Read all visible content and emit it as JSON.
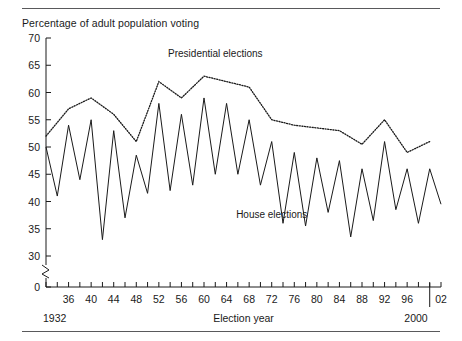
{
  "figure": {
    "y_axis_caption": "Percentage of adult population voting",
    "x_axis_title": "Election year",
    "start_year_label": "1932",
    "end_year_label": "2000",
    "rule_color": "#59595b"
  },
  "chart_data": {
    "type": "line",
    "title": "Percentage of adult population voting",
    "xlabel": "Election year",
    "ylabel": "Percentage of adult population voting",
    "ylim": [
      30,
      70
    ],
    "y_axis_break": true,
    "y_break_from": 30,
    "y_break_to": 0,
    "yticks": [
      0,
      30,
      35,
      40,
      45,
      50,
      55,
      60,
      65,
      70
    ],
    "ytick_labels": [
      "0",
      "30",
      "35",
      "40",
      "45",
      "50",
      "55",
      "60",
      "65",
      "70"
    ],
    "xlim": [
      1932,
      2002
    ],
    "xticks": [
      1932,
      1934,
      1936,
      1938,
      1940,
      1942,
      1944,
      1946,
      1948,
      1950,
      1952,
      1954,
      1956,
      1958,
      1960,
      1962,
      1964,
      1966,
      1968,
      1970,
      1972,
      1974,
      1976,
      1978,
      1980,
      1982,
      1984,
      1986,
      1988,
      1990,
      1992,
      1994,
      1996,
      1998,
      2000,
      2002
    ],
    "xtick_labels": [
      "",
      "",
      "36",
      "",
      "40",
      "",
      "44",
      "",
      "48",
      "",
      "52",
      "",
      "56",
      "",
      "60",
      "",
      "64",
      "",
      "68",
      "",
      "72",
      "",
      "76",
      "",
      "80",
      "",
      "84",
      "",
      "88",
      "",
      "92",
      "",
      "96",
      "",
      "",
      "02"
    ],
    "grid": false,
    "legend_position": "inline-annotations",
    "series": [
      {
        "name": "Presidential elections",
        "style": "dotted",
        "x": [
          1932,
          1936,
          1940,
          1944,
          1948,
          1952,
          1956,
          1960,
          1964,
          1968,
          1972,
          1976,
          1980,
          1984,
          1988,
          1992,
          1996,
          2000
        ],
        "values": [
          52.0,
          57.0,
          59.0,
          56.0,
          51.0,
          62.0,
          59.0,
          63.0,
          62.0,
          61.0,
          55.0,
          54.0,
          53.5,
          53.0,
          50.5,
          55.0,
          49.0,
          51.0
        ]
      },
      {
        "name": "House elections",
        "style": "solid",
        "x": [
          1932,
          1934,
          1936,
          1938,
          1940,
          1942,
          1944,
          1946,
          1948,
          1950,
          1952,
          1954,
          1956,
          1958,
          1960,
          1962,
          1964,
          1966,
          1968,
          1970,
          1972,
          1974,
          1976,
          1978,
          1980,
          1982,
          1984,
          1986,
          1988,
          1990,
          1992,
          1994,
          1996,
          1998,
          2000,
          2002
        ],
        "values": [
          50.0,
          41.0,
          54.0,
          44.0,
          55.0,
          33.0,
          53.0,
          37.0,
          48.5,
          41.5,
          58.0,
          42.0,
          56.0,
          43.0,
          59.0,
          45.0,
          58.0,
          45.0,
          55.0,
          43.0,
          51.0,
          36.0,
          49.0,
          35.5,
          48.0,
          38.0,
          47.5,
          33.5,
          46.0,
          36.5,
          51.0,
          38.5,
          46.0,
          36.0,
          46.0,
          39.5
        ]
      }
    ],
    "annotations": [
      {
        "text": "Presidential elections",
        "x": 1962,
        "y": 66.5
      },
      {
        "text": "House elections",
        "x": 1972,
        "y": 37.0
      }
    ]
  }
}
